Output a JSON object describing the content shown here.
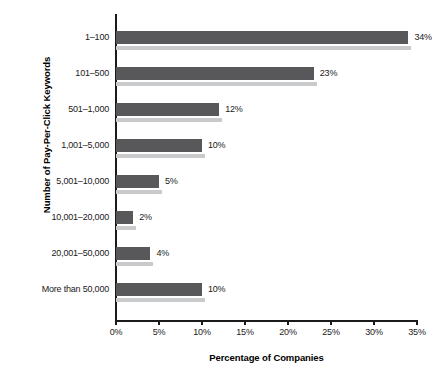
{
  "chart_data": {
    "type": "bar",
    "orientation": "horizontal",
    "title": "",
    "xlabel": "Percentage of Companies",
    "ylabel": "Number of Pay-Per-Click Keywords",
    "categories": [
      "1–100",
      "101–500",
      "501–1,000",
      "1,001–5,000",
      "5,001–10,000",
      "10,001–20,000",
      "20,001–50,000",
      "More than 50,000"
    ],
    "values": [
      34,
      23,
      12,
      10,
      5,
      2,
      4,
      10
    ],
    "value_labels": [
      "34%",
      "23%",
      "12%",
      "10%",
      "5%",
      "2%",
      "4%",
      "10%"
    ],
    "xlim": [
      0,
      35
    ],
    "xticks": [
      0,
      5,
      10,
      15,
      20,
      25,
      30,
      35
    ],
    "xtick_labels": [
      "0%",
      "5%",
      "10%",
      "15%",
      "20%",
      "25%",
      "30%",
      "35%"
    ],
    "grid": false,
    "legend": null,
    "bar_color": "#58585a",
    "bar_shadow_color": "#c9cacb",
    "axis_color": "#1a1a1a",
    "background": "#ffffff"
  }
}
